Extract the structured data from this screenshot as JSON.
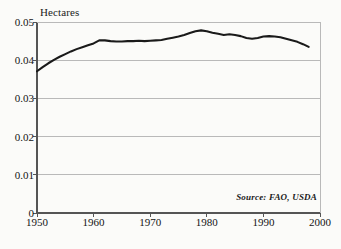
{
  "chart_data": {
    "type": "line",
    "title": "",
    "subtitle": "",
    "ylabel": "Hectares",
    "xlabel": "",
    "ylim": [
      0,
      0.05
    ],
    "xlim": [
      1950,
      2000
    ],
    "grid": true,
    "legend": null,
    "y_ticks": [
      "0.05",
      "0.04",
      "0.03",
      "0.02",
      "0.01",
      "0"
    ],
    "y_tick_values": [
      0.05,
      0.04,
      0.03,
      0.02,
      0.01,
      0
    ],
    "x_ticks": [
      "1950",
      "1960",
      "1970",
      "1980",
      "1990",
      "2000"
    ],
    "x_tick_values": [
      1950,
      1960,
      1970,
      1980,
      1990,
      2000
    ],
    "series": [
      {
        "name": "Grainland per person",
        "color": "#1a1a1a",
        "x": [
          1950,
          1951,
          1952,
          1953,
          1954,
          1955,
          1956,
          1957,
          1958,
          1959,
          1960,
          1961,
          1962,
          1963,
          1964,
          1965,
          1966,
          1967,
          1968,
          1969,
          1970,
          1971,
          1972,
          1973,
          1974,
          1975,
          1976,
          1977,
          1978,
          1979,
          1980,
          1981,
          1982,
          1983,
          1984,
          1985,
          1986,
          1987,
          1988,
          1989,
          1990,
          1991,
          1992,
          1993,
          1994,
          1995,
          1996,
          1997,
          1998
        ],
        "values": [
          0.0371,
          0.0382,
          0.0392,
          0.0401,
          0.0409,
          0.0416,
          0.0423,
          0.0429,
          0.0434,
          0.0439,
          0.0444,
          0.0452,
          0.0452,
          0.045,
          0.0449,
          0.0449,
          0.045,
          0.045,
          0.0451,
          0.045,
          0.0451,
          0.0452,
          0.0453,
          0.0456,
          0.0459,
          0.0462,
          0.0466,
          0.0471,
          0.0476,
          0.0478,
          0.0476,
          0.0472,
          0.0469,
          0.0466,
          0.0468,
          0.0466,
          0.0463,
          0.0458,
          0.0456,
          0.0458,
          0.0462,
          0.0463,
          0.0462,
          0.046,
          0.0456,
          0.0452,
          0.0448,
          0.0442,
          0.0435
        ]
      }
    ],
    "annotations": [
      {
        "name": "source",
        "text": "Source: FAO, USDA"
      }
    ]
  },
  "plot": {
    "left": 37,
    "top": 22,
    "right": 320,
    "bottom": 213,
    "frame_color": "#555555",
    "grid_color": "#b9b9b9",
    "line_color": "#1a1a1a",
    "line_width": 2.1
  }
}
